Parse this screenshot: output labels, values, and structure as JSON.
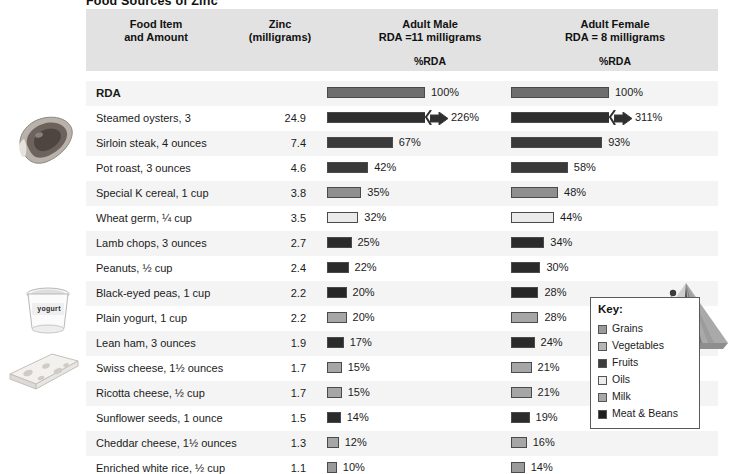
{
  "title": "Food Sources of Zinc",
  "header": {
    "food_item": "Food Item\nand Amount",
    "food_item_line1": "Food Item",
    "food_item_line2": "and Amount",
    "zinc_line1": "Zinc",
    "zinc_line2": "(milligrams)",
    "male_line1": "Adult Male",
    "male_line2": "RDA =11 milligrams",
    "female_line1": "Adult Female",
    "female_line2": "RDA = 8 milligrams",
    "male_sub": "%RDA",
    "female_sub": "%RDA"
  },
  "key": {
    "title": "Key:",
    "items": [
      {
        "label": "Grains",
        "color": "#9a9a9a"
      },
      {
        "label": "Vegetables",
        "color": "#b5b5b5"
      },
      {
        "label": "Fruits",
        "color": "#3c3c3c"
      },
      {
        "label": "Oils",
        "color": "#ececec"
      },
      {
        "label": "Milk",
        "color": "#a8a8a8"
      },
      {
        "label": "Meat & Beans",
        "color": "#1e1e1e"
      }
    ]
  },
  "photos": [
    {
      "name": "steak-photo",
      "label": ""
    },
    {
      "name": "yogurt-photo",
      "label": "yogurt"
    },
    {
      "name": "cheese-photo",
      "label": ""
    }
  ],
  "chart_data": {
    "type": "bar",
    "title": "Food Sources of Zinc",
    "xlabel": "%RDA",
    "ylabel": "Food Item and Amount",
    "xlim": [
      0,
      100
    ],
    "grid": false,
    "legend_position": "bottom-right",
    "columns": [
      "Food Item and Amount",
      "Zinc (milligrams)",
      "Adult Male %RDA",
      "Adult Female %RDA"
    ],
    "categories": [
      "RDA",
      "Steamed oysters, 3",
      "Sirloin steak, 4 ounces",
      "Pot roast, 3 ounces",
      "Special K cereal, 1 cup",
      "Wheat germ, ¼ cup",
      "Lamb chops, 3 ounces",
      "Peanuts, ½ cup",
      "Black-eyed peas, 1 cup",
      "Plain yogurt, 1 cup",
      "Lean ham, 3 ounces",
      "Swiss cheese, 1½ ounces",
      "Ricotta cheese, ½ cup",
      "Sunflower seeds,  1 ounce",
      "Cheddar cheese, 1½ ounces",
      "Enriched white rice, ½ cup"
    ],
    "series": [
      {
        "name": "Zinc (milligrams)",
        "values": [
          null,
          24.9,
          7.4,
          4.6,
          3.8,
          3.5,
          2.7,
          2.4,
          2.2,
          2.2,
          1.9,
          1.7,
          1.7,
          1.5,
          1.3,
          1.1
        ]
      },
      {
        "name": "Adult Male %RDA",
        "values": [
          100,
          226,
          67,
          42,
          35,
          32,
          25,
          22,
          20,
          20,
          17,
          15,
          15,
          14,
          12,
          10
        ]
      },
      {
        "name": "Adult Female %RDA",
        "values": [
          100,
          311,
          93,
          58,
          48,
          44,
          34,
          30,
          28,
          28,
          24,
          21,
          21,
          19,
          16,
          14
        ]
      }
    ],
    "rows": [
      {
        "food": "RDA",
        "zinc": "",
        "male_pct": "100%",
        "female_pct": "100%",
        "male_value": 100,
        "female_value": 100,
        "group": "RDA",
        "color": "#6e6e6e",
        "broken": false,
        "bold": true
      },
      {
        "food": "Steamed oysters, 3",
        "zinc": "24.9",
        "male_pct": "226%",
        "female_pct": "311%",
        "male_value": 226,
        "female_value": 311,
        "group": "Meat & Beans",
        "color": "#2f2f2f",
        "broken": true,
        "bold": false
      },
      {
        "food": "Sirloin steak, 4 ounces",
        "zinc": "7.4",
        "male_pct": "67%",
        "female_pct": "93%",
        "male_value": 67,
        "female_value": 93,
        "group": "Meat & Beans",
        "color": "#3a3a3a",
        "broken": false,
        "bold": false
      },
      {
        "food": "Pot roast, 3 ounces",
        "zinc": "4.6",
        "male_pct": "42%",
        "female_pct": "58%",
        "male_value": 42,
        "female_value": 58,
        "group": "Meat & Beans",
        "color": "#3a3a3a",
        "broken": false,
        "bold": false
      },
      {
        "food": "Special K cereal, 1 cup",
        "zinc": "3.8",
        "male_pct": "35%",
        "female_pct": "48%",
        "male_value": 35,
        "female_value": 48,
        "group": "Grains",
        "color": "#8f8f8f",
        "broken": false,
        "bold": false
      },
      {
        "food": "Wheat germ, ¼ cup",
        "zinc": "3.5",
        "male_pct": "32%",
        "female_pct": "44%",
        "male_value": 32,
        "female_value": 44,
        "group": "Oils",
        "color": "#eaeaea",
        "broken": false,
        "bold": false
      },
      {
        "food": "Lamb chops, 3 ounces",
        "zinc": "2.7",
        "male_pct": "25%",
        "female_pct": "34%",
        "male_value": 25,
        "female_value": 34,
        "group": "Meat & Beans",
        "color": "#2b2b2b",
        "broken": false,
        "bold": false
      },
      {
        "food": "Peanuts, ½ cup",
        "zinc": "2.4",
        "male_pct": "22%",
        "female_pct": "30%",
        "male_value": 22,
        "female_value": 30,
        "group": "Meat & Beans",
        "color": "#2b2b2b",
        "broken": false,
        "bold": false
      },
      {
        "food": "Black-eyed peas, 1 cup",
        "zinc": "2.2",
        "male_pct": "20%",
        "female_pct": "28%",
        "male_value": 20,
        "female_value": 28,
        "group": "Meat & Beans",
        "color": "#262626",
        "broken": false,
        "bold": false
      },
      {
        "food": "Plain yogurt, 1 cup",
        "zinc": "2.2",
        "male_pct": "20%",
        "female_pct": "28%",
        "male_value": 20,
        "female_value": 28,
        "group": "Milk",
        "color": "#a6a6a6",
        "broken": false,
        "bold": false
      },
      {
        "food": "Lean ham, 3 ounces",
        "zinc": "1.9",
        "male_pct": "17%",
        "female_pct": "24%",
        "male_value": 17,
        "female_value": 24,
        "group": "Meat & Beans",
        "color": "#2b2b2b",
        "broken": false,
        "bold": false
      },
      {
        "food": "Swiss cheese, 1½ ounces",
        "zinc": "1.7",
        "male_pct": "15%",
        "female_pct": "21%",
        "male_value": 15,
        "female_value": 21,
        "group": "Milk",
        "color": "#a6a6a6",
        "broken": false,
        "bold": false
      },
      {
        "food": "Ricotta cheese, ½ cup",
        "zinc": "1.7",
        "male_pct": "15%",
        "female_pct": "21%",
        "male_value": 15,
        "female_value": 21,
        "group": "Milk",
        "color": "#a6a6a6",
        "broken": false,
        "bold": false
      },
      {
        "food": "Sunflower seeds,  1 ounce",
        "zinc": "1.5",
        "male_pct": "14%",
        "female_pct": "19%",
        "male_value": 14,
        "female_value": 19,
        "group": "Meat & Beans",
        "color": "#2b2b2b",
        "broken": false,
        "bold": false
      },
      {
        "food": "Cheddar cheese, 1½ ounces",
        "zinc": "1.3",
        "male_pct": "12%",
        "female_pct": "16%",
        "male_value": 12,
        "female_value": 16,
        "group": "Milk",
        "color": "#a6a6a6",
        "broken": false,
        "bold": false
      },
      {
        "food": "Enriched white rice, ½ cup",
        "zinc": "1.1",
        "male_pct": "10%",
        "female_pct": "14%",
        "male_value": 10,
        "female_value": 14,
        "group": "Grains",
        "color": "#9a9a9a",
        "broken": false,
        "bold": false
      }
    ]
  }
}
